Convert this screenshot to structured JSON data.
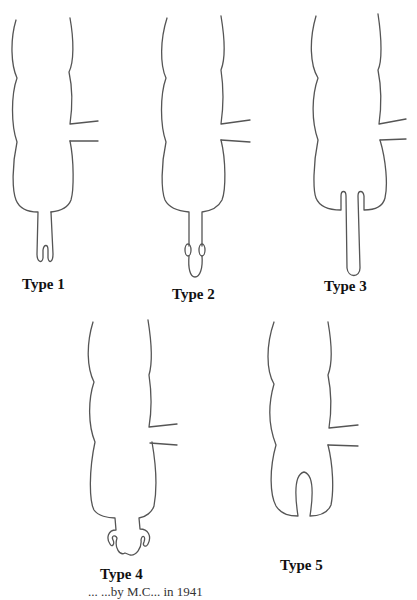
{
  "figures": [
    {
      "label": "Type 1",
      "description": "Segmented body with narrow stalk ending in bilobed U-shaped tip"
    },
    {
      "label": "Type 2",
      "description": "Segmented body with narrow stalk, small paired lobes, and rounded terminal loop"
    },
    {
      "label": "Type 3",
      "description": "Segmented body with long single finger-like tube projecting from base"
    },
    {
      "label": "Type 4",
      "description": "Segmented body with short stalk ending in curled hook-like paired lobes"
    },
    {
      "label": "Type 5",
      "description": "Segmented body with an arched notch cut into the base"
    }
  ],
  "caption": "...                                                        ...by M.C...  in 1941"
}
